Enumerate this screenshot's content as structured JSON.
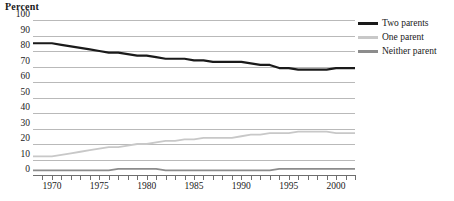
{
  "chart_data": {
    "type": "line",
    "title": "",
    "ylabel": "Percent",
    "xlabel": "",
    "ylim": [
      0,
      100
    ],
    "ytick_step": 10,
    "yticks": [
      100,
      90,
      80,
      70,
      60,
      50,
      40,
      30,
      20,
      10,
      0
    ],
    "xlim": [
      1968,
      2002
    ],
    "xticks_major": [
      1970,
      1975,
      1980,
      1985,
      1990,
      1995,
      2000
    ],
    "xtick_labels": [
      "1970",
      "1975",
      "1980",
      "1985",
      "1990",
      "1995",
      "2000"
    ],
    "xticks_minor_every": 1,
    "grid": "horizontal",
    "legend_position": "right",
    "x": [
      1968,
      1969,
      1970,
      1971,
      1972,
      1973,
      1974,
      1975,
      1976,
      1977,
      1978,
      1979,
      1980,
      1981,
      1982,
      1983,
      1984,
      1985,
      1986,
      1987,
      1988,
      1989,
      1990,
      1991,
      1992,
      1993,
      1994,
      1995,
      1996,
      1997,
      1998,
      1999,
      2000,
      2001,
      2002
    ],
    "series": [
      {
        "name": "Two parents",
        "color": "#1a1a1a",
        "values": [
          85,
          85,
          85,
          84,
          83,
          82,
          81,
          80,
          79,
          79,
          78,
          77,
          77,
          76,
          75,
          75,
          75,
          74,
          74,
          73,
          73,
          73,
          73,
          72,
          71,
          71,
          69,
          69,
          68,
          68,
          68,
          68,
          69,
          69,
          69
        ]
      },
      {
        "name": "One parent",
        "color": "#c8c8c8",
        "values": [
          12,
          12,
          12,
          13,
          14,
          15,
          16,
          17,
          18,
          18,
          19,
          20,
          20,
          21,
          22,
          22,
          23,
          23,
          24,
          24,
          24,
          24,
          25,
          26,
          26,
          27,
          27,
          27,
          28,
          28,
          28,
          28,
          27,
          27,
          27
        ]
      },
      {
        "name": "Neither parent",
        "color": "#8c8c8c",
        "values": [
          3,
          3,
          3,
          3,
          3,
          3,
          3,
          3,
          3,
          4,
          4,
          4,
          4,
          4,
          3,
          3,
          3,
          3,
          3,
          3,
          3,
          3,
          3,
          3,
          3,
          3,
          4,
          4,
          4,
          4,
          4,
          4,
          4,
          4,
          4
        ]
      }
    ],
    "colors": {
      "gridline": "#b9b9b9",
      "axis": "#6e6e6e",
      "text": "#1a1a1a",
      "background": "#ffffff"
    }
  },
  "legend": {
    "entries": [
      {
        "label": "Two parents"
      },
      {
        "label": "One parent"
      },
      {
        "label": "Neither parent"
      }
    ]
  }
}
